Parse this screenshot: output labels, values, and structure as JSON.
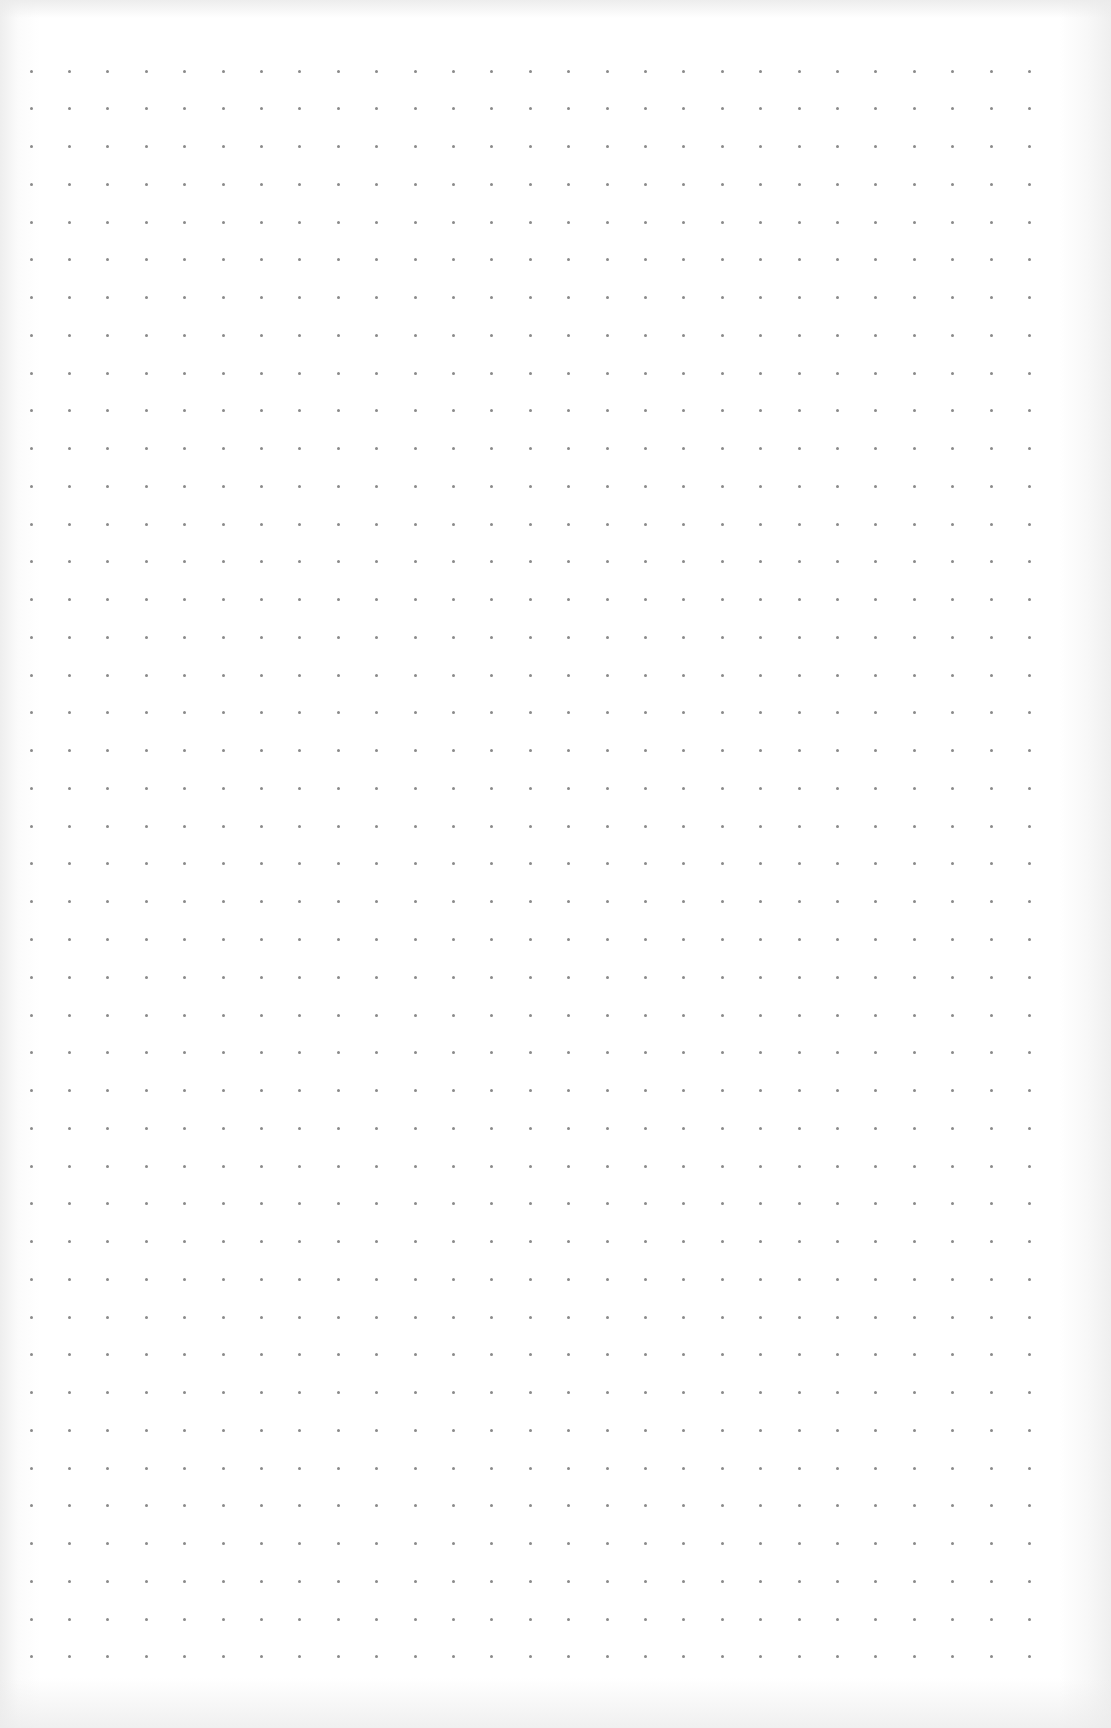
{
  "page": {
    "type": "dot-grid-paper",
    "background_color": "#ffffff",
    "dot_color": "#8a8a8a"
  },
  "grid": {
    "columns": 27,
    "rows": 43,
    "origin_x": 31,
    "origin_y": 71,
    "spacing_x": 38.4,
    "spacing_y": 37.76,
    "dot_size": 3
  }
}
